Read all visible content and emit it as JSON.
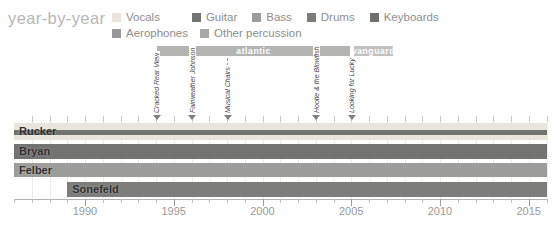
{
  "title": "year-by-year",
  "chart_data": {
    "type": "timeline",
    "title": "year-by-year",
    "x_axis": {
      "min": 1986,
      "max": 2016,
      "major_ticks": [
        1990,
        1995,
        2000,
        2005,
        2010,
        2015
      ],
      "minor_tick_every_years": 1,
      "grid": true
    },
    "legend": {
      "position": "top",
      "rows": [
        [
          {
            "label": "Vocals",
            "color": "#e8e6dc"
          },
          {
            "label": "Guitar",
            "color": "#737371"
          },
          {
            "label": "Bass",
            "color": "#9c9c9a"
          },
          {
            "label": "Drums",
            "color": "#7d7d7b"
          },
          {
            "label": "Keyboards",
            "color": "#6f6f6d"
          }
        ],
        [
          {
            "label": "Aerophones",
            "color": "#98989b"
          },
          {
            "label": "Other percussion",
            "color": "#a8a8a6"
          }
        ]
      ]
    },
    "record_labels": [
      {
        "label": "atlantic",
        "from": 1994,
        "to": 2005,
        "color": "#b4b4b2"
      },
      {
        "label": "vanguard",
        "from": 2005.1,
        "to": 2007.4,
        "color": "#c1c1bf"
      }
    ],
    "albums": [
      {
        "title": "Cracked Rear View",
        "year": 1994
      },
      {
        "title": "Fairweather Johnson",
        "year": 1996
      },
      {
        "title": "Musical Chairs",
        "year": 1998
      },
      {
        "title": "Hootie & the Blowfish",
        "year": 2003
      },
      {
        "title": "Looking for Lucky",
        "year": 2005
      }
    ],
    "members": [
      {
        "name": "Rucker",
        "from": 1986,
        "to": 2016,
        "stripes": [
          {
            "instrument": "Vocals",
            "weight": 7
          },
          {
            "instrument": "Guitar",
            "weight": 6
          },
          {
            "instrument": "Vocals",
            "weight": 5
          }
        ]
      },
      {
        "name": "Bryan",
        "from": 1986,
        "to": 2016,
        "stripes": [
          {
            "instrument": "Guitar",
            "weight": 1
          }
        ]
      },
      {
        "name": "Felber",
        "from": 1986,
        "to": 2016,
        "stripes": [
          {
            "instrument": "Bass",
            "weight": 1
          }
        ]
      },
      {
        "name": "Sonefeld",
        "from": 1989,
        "to": 2016,
        "stripes": [
          {
            "instrument": "Drums",
            "weight": 1
          }
        ]
      }
    ]
  }
}
